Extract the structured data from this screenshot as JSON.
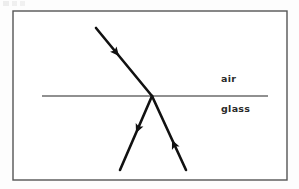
{
  "figure": {
    "background_color": "#fdfdfd",
    "frame": {
      "stroke_color": "#555555",
      "fill_color": "#ffffff",
      "x": 13,
      "y": 11,
      "width": 274,
      "height": 169,
      "stroke_width": 1.4
    }
  },
  "labels": {
    "air": "air",
    "glass": "glass",
    "text_color": "#2a2a2a",
    "font_size_px": 9.5
  },
  "chart_data": {
    "type": "diagram",
    "media": [
      {
        "name": "air",
        "region": "above interface",
        "label": "air"
      },
      {
        "name": "glass",
        "region": "below interface",
        "label": "glass"
      }
    ],
    "interface": {
      "name": "air-glass boundary",
      "orientation": "horizontal",
      "x1": 42,
      "y1": 96,
      "x2": 268,
      "y2": 96,
      "color": "#6b6b6b",
      "stroke_width": 1.3
    },
    "incidence_point": {
      "x": 152,
      "y": 96
    },
    "rays": [
      {
        "name": "incident-ray",
        "description": "ray travelling down-right through air toward the boundary",
        "x1": 96,
        "y1": 28,
        "x2": 152,
        "y2": 96,
        "color": "#111111",
        "stroke_width": 2.6,
        "arrow": {
          "x": 119,
          "y": 56,
          "direction": "down-right",
          "angle_deg": 50.5
        }
      },
      {
        "name": "transmitted-ray",
        "description": "ray continuing down-right inside the glass, arrowhead pointing back up toward the boundary",
        "x1": 152,
        "y1": 96,
        "x2": 186,
        "y2": 170,
        "color": "#111111",
        "stroke_width": 2.6,
        "arrow": {
          "x": 172,
          "y": 140,
          "direction": "up-left",
          "angle_deg": -114.7
        }
      },
      {
        "name": "second-ray",
        "description": "ray in the glass running down-left from the boundary with arrowhead pointing down-left",
        "x1": 152,
        "y1": 96,
        "x2": 120,
        "y2": 170,
        "color": "#111111",
        "stroke_width": 2.6,
        "arrow": {
          "x": 136,
          "y": 133,
          "direction": "down-left",
          "angle_deg": 113.4
        }
      }
    ],
    "grid": false,
    "legend": false,
    "annotations": [
      {
        "text": "air",
        "x": 221,
        "y": 79
      },
      {
        "text": "glass",
        "x": 221,
        "y": 110
      }
    ]
  }
}
